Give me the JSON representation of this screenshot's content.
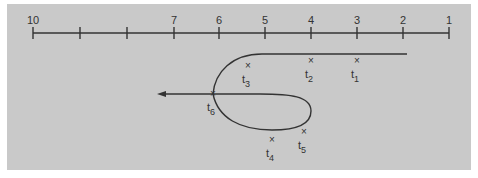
{
  "figure": {
    "background_color": "#c9c9c9",
    "line_color": "#333333",
    "axis": {
      "ticks": [
        {
          "label": "10",
          "x": 33
        },
        {
          "label": "",
          "x": 80
        },
        {
          "label": "",
          "x": 127
        },
        {
          "label": "7",
          "x": 174
        },
        {
          "label": "6",
          "x": 219
        },
        {
          "label": "5",
          "x": 265
        },
        {
          "label": "4",
          "x": 311
        },
        {
          "label": "3",
          "x": 357
        },
        {
          "label": "2",
          "x": 403
        },
        {
          "label": "1",
          "x": 449
        }
      ]
    },
    "markers": [
      {
        "name": "t1",
        "base": "t",
        "sub": "1",
        "x": 357,
        "y": 61
      },
      {
        "name": "t2",
        "base": "t",
        "sub": "2",
        "x": 311,
        "y": 61
      },
      {
        "name": "t3",
        "base": "t",
        "sub": "3",
        "x": 248,
        "y": 66
      },
      {
        "name": "t4",
        "base": "t",
        "sub": "4",
        "x": 272,
        "y": 140
      },
      {
        "name": "t5",
        "base": "t",
        "sub": "5",
        "x": 304,
        "y": 132
      },
      {
        "name": "t6",
        "base": "t",
        "sub": "6",
        "x": 213,
        "y": 94
      }
    ]
  }
}
